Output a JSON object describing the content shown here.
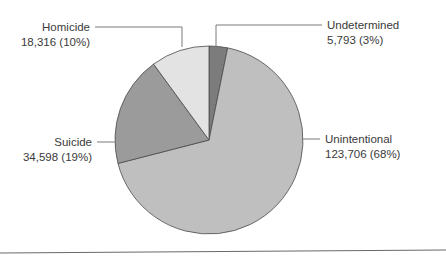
{
  "chart_data": {
    "type": "pie",
    "title": "",
    "start_angle_deg": 0,
    "direction": "clockwise",
    "categories": [
      "Undetermined",
      "Unintentional",
      "Suicide",
      "Homicide"
    ],
    "values": [
      5793,
      123706,
      34598,
      18316
    ],
    "percent_labels": [
      "3%",
      "68%",
      "19%",
      "10%"
    ],
    "colors": [
      "#7c7c7c",
      "#bfbfbf",
      "#9b9b9b",
      "#e3e3e3"
    ],
    "labels": [
      {
        "name": "Undetermined",
        "value_text": "5,793 (3%)"
      },
      {
        "name": "Unintentional",
        "value_text": "123,706 (68%)"
      },
      {
        "name": "Suicide",
        "value_text": "34,598 (19%)"
      },
      {
        "name": "Homicide",
        "value_text": "18,316 (10%)"
      }
    ],
    "legend": "none (direct labels with leader lines)"
  },
  "labels": {
    "undetermined": {
      "name": "Undetermined",
      "value": "5,793 (3%)"
    },
    "unintentional": {
      "name": "Unintentional",
      "value": "123,706 (68%)"
    },
    "suicide": {
      "name": "Suicide",
      "value": "34,598 (19%)"
    },
    "homicide": {
      "name": "Homicide",
      "value": "18,316 (10%)"
    }
  }
}
